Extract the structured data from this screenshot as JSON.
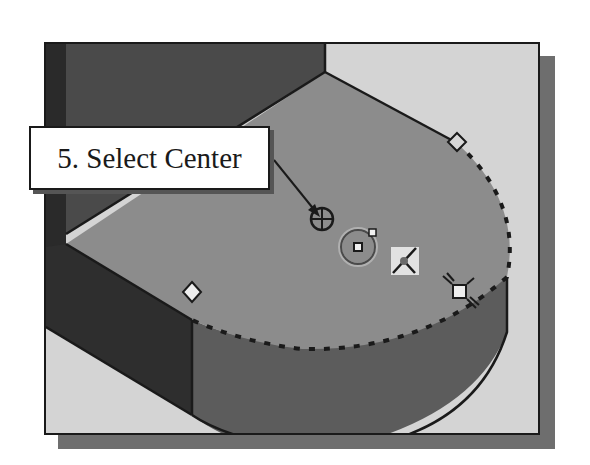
{
  "figure": {
    "callout": {
      "step_label": "5. Select Center"
    },
    "icons": [
      {
        "name": "cursor-arrow-icon",
        "description": "leader arrow from callout to pick cursor"
      },
      {
        "name": "center-pick-cursor-icon",
        "description": "crosshair pick cursor at arc center"
      },
      {
        "name": "center-snap-icon",
        "description": "circle with center point snap marker"
      },
      {
        "name": "tangent-constraint-icon",
        "description": "constraint glyph in light square"
      },
      {
        "name": "endpoint-snap-icon",
        "description": "square endpoint snap with rays"
      },
      {
        "name": "vertex-diamond-icon",
        "description": "diamond vertex markers on arc endpoints"
      }
    ],
    "colors": {
      "background_plane": "#d4d4d4",
      "top_face": "#8c8c8c",
      "back_wall": "#4a4a4a",
      "left_wall": "#2e2e2e",
      "side_face": "#5c5c5c",
      "edge": "#1a1a1a",
      "frame_shadow": "#6e6e6e"
    }
  }
}
